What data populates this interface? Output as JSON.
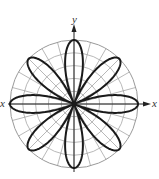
{
  "chart_data": {
    "type": "polar",
    "equation_form": "r = a cos(4θ)",
    "petals": 8,
    "petal_angles_deg": [
      0,
      45,
      90,
      135,
      180,
      225,
      270,
      315
    ],
    "grid": {
      "on": true,
      "circles": 5,
      "radial_spacing_deg": 15
    },
    "axes": {
      "x_label": "x",
      "y_label": "y",
      "x_arrow": true,
      "y_arrow": true
    },
    "title": "",
    "colors": {
      "curve": "#1a1a1a",
      "grid": "#9a9a9a",
      "axis": "#222222"
    }
  }
}
